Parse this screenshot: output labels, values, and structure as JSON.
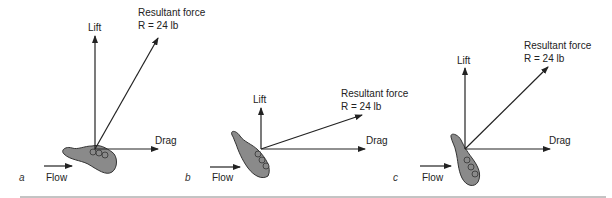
{
  "figure": {
    "panels": [
      {
        "id": "a",
        "panel_label": "a",
        "lift": "Lift",
        "drag": "Drag",
        "resultant_title": "Resultant force",
        "resultant_value": "R = 24 lb",
        "flow": "Flow"
      },
      {
        "id": "b",
        "panel_label": "b",
        "lift": "Lift",
        "drag": "Drag",
        "resultant_title": "Resultant force",
        "resultant_value": "R = 24 lb",
        "flow": "Flow"
      },
      {
        "id": "c",
        "panel_label": "c",
        "lift": "Lift",
        "drag": "Drag",
        "resultant_title": "Resultant force",
        "resultant_value": "R = 24 lb",
        "flow": "Flow"
      }
    ],
    "colors": {
      "hand_fill": "#8a8a8a",
      "stroke": "#222222",
      "rule": "#888888"
    }
  }
}
